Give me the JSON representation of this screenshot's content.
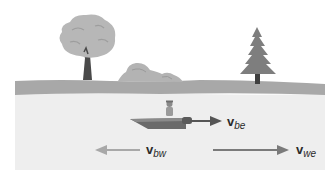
{
  "figure": {
    "colors": {
      "background": "#ffffff",
      "ground": "#a9a9a9",
      "water": "#eeeeee",
      "tree_foliage": "#b5b5b5",
      "tree_trunk": "#4a4a4a",
      "pine": "#7d7d7d",
      "bush": "#b0b0b0",
      "boat": "#6e6e6e",
      "arrow_dark": "#555555",
      "arrow_light": "#a8a8a8",
      "arrow_medium": "#7a7a7a"
    },
    "vectors": [
      {
        "id": "be",
        "symbol": "v",
        "subscript": "be",
        "direction": "right",
        "meaning": "velocity of boat relative to earth"
      },
      {
        "id": "bw",
        "symbol": "v",
        "subscript": "bw",
        "direction": "left",
        "meaning": "velocity of boat relative to water"
      },
      {
        "id": "we",
        "symbol": "v",
        "subscript": "we",
        "direction": "right",
        "meaning": "velocity of water relative to earth"
      }
    ]
  },
  "labels": {
    "vbe": {
      "main": "v",
      "sub": "be"
    },
    "vbw": {
      "main": "v",
      "sub": "bw"
    },
    "vwe": {
      "main": "v",
      "sub": "we"
    }
  }
}
